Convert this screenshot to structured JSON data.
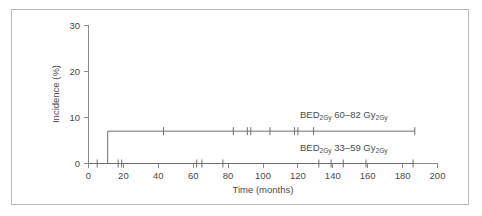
{
  "chart_data": {
    "type": "line",
    "title": "",
    "xlabel": "Time (months)",
    "ylabel": "Incidence (%)",
    "xlim": [
      0,
      200
    ],
    "ylim": [
      0,
      30
    ],
    "xticks": [
      0,
      20,
      40,
      60,
      80,
      100,
      120,
      140,
      160,
      180,
      200
    ],
    "ytick_labels": [
      "0",
      "10",
      "20",
      "30"
    ],
    "yticks": [
      0,
      10,
      20,
      30
    ],
    "grid": false,
    "legend_position": "inline-right",
    "line_color": "#6e6e6e",
    "axis_color": "#8c8c8c",
    "series": [
      {
        "name": "BED2Gy 60-82 Gy2Gy",
        "label_prefix": "BED",
        "label_sub1": "2Gy",
        "label_range": " 60–82 Gy",
        "label_sub2": "2Gy",
        "label_x": 120,
        "label_y": 9.6,
        "step_points": [
          [
            0,
            0
          ],
          [
            11,
            0
          ],
          [
            11,
            7
          ],
          [
            187,
            7
          ]
        ],
        "censor_times": [
          43,
          83,
          91,
          93,
          104,
          118,
          120,
          129,
          187
        ],
        "censor_value": 7
      },
      {
        "name": "BED2Gy 33-59 Gy2Gy",
        "label_prefix": "BED",
        "label_sub1": "2Gy",
        "label_range": " 33–59 Gy",
        "label_sub2": "2Gy",
        "label_x": 120,
        "label_y": 3.1,
        "step_points": [
          [
            0,
            0
          ],
          [
            187,
            0
          ]
        ],
        "censor_times": [
          5,
          17,
          19,
          62,
          65,
          77,
          132,
          139,
          146,
          159,
          186
        ],
        "censor_value": 0
      }
    ]
  },
  "axis": {
    "x_title": "Time (months)",
    "y_title": "Incidence (%)",
    "x_tick_labels": [
      "0",
      "20",
      "40",
      "60",
      "80",
      "100",
      "120",
      "140",
      "160",
      "180",
      "200"
    ],
    "y_tick_labels": [
      "30",
      "20",
      "10",
      "0"
    ]
  }
}
